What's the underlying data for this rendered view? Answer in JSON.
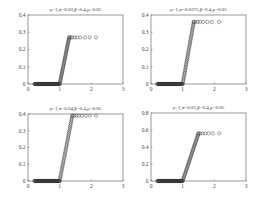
{
  "chart_data": [
    {
      "type": "scatter",
      "title": "ρ=1,σ=0.03,β=0.4,μ=0.05",
      "xlabel": "",
      "ylabel": "",
      "xlim": [
        0,
        3
      ],
      "ylim": [
        0,
        0.4
      ],
      "xticks": [
        "0",
        "1",
        "2",
        "3"
      ],
      "yticks": [
        "0",
        "0.1",
        "0.2",
        "0.3",
        "0.4"
      ],
      "grid": false,
      "marker": "circle-open",
      "series": [
        {
          "name": "data",
          "flat": {
            "x_start": 0.2,
            "x_end": 1.0,
            "y": 0
          },
          "ramp": {
            "x_start": 1.0,
            "x_end": 1.3,
            "y_end": 0.27
          },
          "plateau": {
            "y": 0.27,
            "x": [
              1.3,
              1.35,
              1.4,
              1.47,
              1.55,
              1.65,
              1.8,
              1.95,
              2.15
            ]
          }
        }
      ]
    },
    {
      "type": "scatter",
      "title": "ρ=1,σ=0.0375,β=0.4,μ=0.05",
      "xlabel": "",
      "ylabel": "",
      "xlim": [
        0,
        3
      ],
      "ylim": [
        0,
        0.4
      ],
      "xticks": [
        "0",
        "1",
        "2",
        "3"
      ],
      "yticks": [
        "0",
        "0.1",
        "0.2",
        "0.3",
        "0.4"
      ],
      "grid": false,
      "marker": "circle-open",
      "series": [
        {
          "name": "data",
          "flat": {
            "x_start": 0.2,
            "x_end": 1.0,
            "y": 0
          },
          "ramp": {
            "x_start": 1.0,
            "x_end": 1.35,
            "y_end": 0.36
          },
          "plateau": {
            "y": 0.36,
            "x": [
              1.35,
              1.4,
              1.47,
              1.55,
              1.65,
              1.78,
              1.92,
              2.15
            ]
          }
        }
      ]
    },
    {
      "type": "scatter",
      "title": "ρ=1,σ=0.04,β=0.4,μ=0.05",
      "xlabel": "",
      "ylabel": "",
      "xlim": [
        0,
        3
      ],
      "ylim": [
        0,
        0.4
      ],
      "xticks": [
        "0",
        "1",
        "2",
        "3"
      ],
      "yticks": [
        "0",
        "0.1",
        "0.2",
        "0.3",
        "0.4"
      ],
      "grid": false,
      "marker": "circle-open",
      "series": [
        {
          "name": "data",
          "flat": {
            "x_start": 0.2,
            "x_end": 1.0,
            "y": 0
          },
          "ramp": {
            "x_start": 1.0,
            "x_end": 1.4,
            "y_end": 0.39
          },
          "plateau": {
            "y": 0.39,
            "x": [
              1.4,
              1.46,
              1.53,
              1.6,
              1.7,
              1.82,
              1.95,
              2.15
            ]
          }
        }
      ]
    },
    {
      "type": "scatter",
      "title": "ρ=1,σ=0.05,β=0.4,μ=0.05",
      "xlabel": "",
      "ylabel": "",
      "xlim": [
        0,
        3
      ],
      "ylim": [
        0,
        0.8
      ],
      "xticks": [
        "0",
        "1",
        "2",
        "3"
      ],
      "yticks": [
        "0",
        "0.2",
        "0.4",
        "0.6",
        "0.8"
      ],
      "grid": false,
      "marker": "circle-open",
      "series": [
        {
          "name": "data",
          "flat": {
            "x_start": 0.2,
            "x_end": 1.0,
            "y": 0
          },
          "ramp": {
            "x_start": 1.0,
            "x_end": 1.5,
            "y_end": 0.56
          },
          "plateau": {
            "y": 0.56,
            "x": [
              1.5,
              1.56,
              1.63,
              1.72,
              1.82,
              1.95,
              2.15
            ]
          }
        }
      ]
    }
  ],
  "layout": {
    "panels": [
      {
        "x0": 28,
        "y0": 15,
        "x1": 123,
        "y1": 84
      },
      {
        "x0": 151,
        "y0": 15,
        "x1": 246,
        "y1": 84
      },
      {
        "x0": 28,
        "y0": 114,
        "x1": 123,
        "y1": 181
      },
      {
        "x0": 151,
        "y0": 113,
        "x1": 246,
        "y1": 181
      }
    ],
    "colors": {
      "axis": "#555555",
      "marker": "#333333",
      "background": "#ffffff"
    }
  }
}
